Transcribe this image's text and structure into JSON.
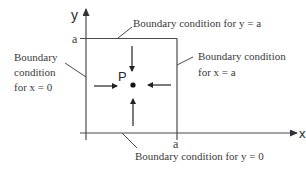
{
  "diagram": {
    "axes": {
      "x_label": "x",
      "y_label": "y",
      "x_tick": "a",
      "y_tick": "a"
    },
    "point_label": "P",
    "labels": {
      "top": "Boundary condition for  y = a",
      "bottom": "Boundary condition for  y = 0",
      "left_line1": "Boundary",
      "left_line2": "condition",
      "left_line3": "for  x = 0",
      "right_line1": "Boundary condition",
      "right_line2": "for  x = a"
    },
    "colors": {
      "line": "#4a4a4a",
      "text": "#3a3a3a",
      "background": "#ffffff"
    }
  }
}
